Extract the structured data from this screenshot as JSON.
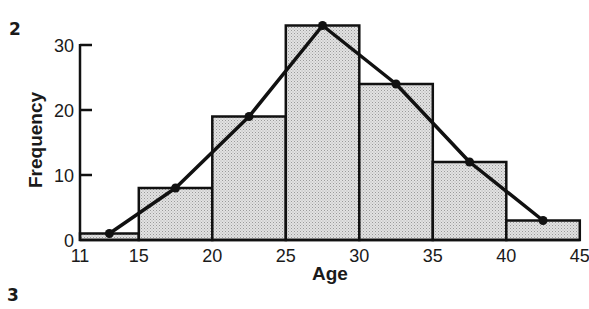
{
  "figure_labels": {
    "top": "2",
    "bottom": "3"
  },
  "chart_data": {
    "type": "bar",
    "subtype": "histogram_with_frequency_polygon",
    "title": "",
    "xlabel": "Age",
    "ylabel": "Frequency",
    "x_ticks": [
      11,
      15,
      20,
      25,
      30,
      35,
      40,
      45
    ],
    "x_tick_labels": [
      "11",
      "15",
      "20",
      "25",
      "30",
      "35",
      "40",
      "45"
    ],
    "y_ticks": [
      0,
      10,
      20,
      30
    ],
    "y_tick_labels": [
      "0",
      "10",
      "20",
      "30"
    ],
    "ylim": [
      0,
      33
    ],
    "xlim": [
      11,
      45
    ],
    "grid": false,
    "legend": null,
    "bins": [
      {
        "range": "11-15",
        "start": 11,
        "end": 15,
        "value": 1
      },
      {
        "range": "15-20",
        "start": 15,
        "end": 20,
        "value": 8
      },
      {
        "range": "20-25",
        "start": 20,
        "end": 25,
        "value": 19
      },
      {
        "range": "25-30",
        "start": 25,
        "end": 30,
        "value": 33
      },
      {
        "range": "30-35",
        "start": 30,
        "end": 35,
        "value": 24
      },
      {
        "range": "35-40",
        "start": 35,
        "end": 40,
        "value": 12
      },
      {
        "range": "40-45",
        "start": 40,
        "end": 45,
        "value": 3
      }
    ],
    "categories": [
      "11-15",
      "15-20",
      "20-25",
      "25-30",
      "30-35",
      "35-40",
      "40-45"
    ],
    "values": [
      1,
      8,
      19,
      33,
      24,
      12,
      3
    ],
    "polygon": {
      "x": [
        13,
        17.5,
        22.5,
        27.5,
        32.5,
        37.5,
        42.5
      ],
      "y": [
        1,
        8,
        19,
        33,
        24,
        12,
        3
      ]
    },
    "colors": {
      "bar_fill": "#d9d9d9",
      "bar_stroke": "#111111",
      "line": "#111111"
    }
  }
}
